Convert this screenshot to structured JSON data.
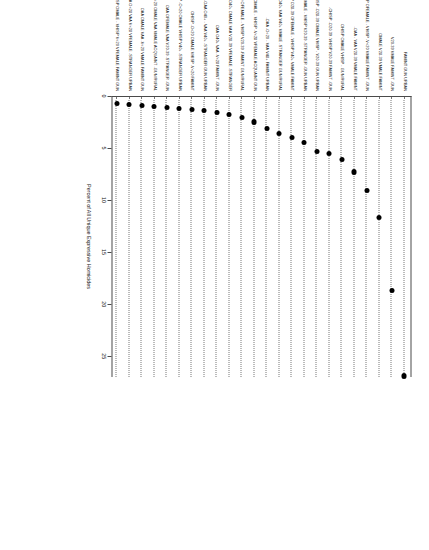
{
  "figure": {
    "orientation": "rotated-90-landscape-on-portrait-page",
    "background_color": "#ffffff",
    "dot_color": "#000000",
    "guide_style": "dotted",
    "axis_color": "#4a4a4a"
  },
  "chart_data": {
    "type": "scatter",
    "title": "",
    "subtitle": "",
    "xlabel": "Percent of All Unique Expressive Homicides",
    "ylabel": "",
    "xlim": [
      0,
      27
    ],
    "xticks": [
      0,
      5,
      10,
      15,
      20,
      25
    ],
    "xticklabels": [
      "0",
      "5",
      "10",
      "15",
      "20",
      "25"
    ],
    "grid": "dotted-horizontal-guides-per-category",
    "legend": "none",
    "categories": [
      "FAMINT GUN URBAN",
      "V20-39 VMALE FAMINT -GUN",
      "OMALE V20-39 VMALE FAMINT",
      "-CHISP OFEMALE - VHISP -V<20 VMALE FAMINT -GUN",
      "-OAA - VAA V20-39 VMALE FAMINT",
      "OHISP OMALE VHISP - GUN RURAL",
      "-CHISP -O20-39 -VHISP V20-39 FAMINT -GUN",
      "-CHISP -O20-39 OMALE VHISP - V20-39 GUN URBAN",
      "-CHISP OFEMALE - VHISP V20-39 -STRANGER -GUN URBAN",
      "-CHISP O20-39 OFEMALE - VHISP V40+ VMALE FAMINT",
      "OAA O40+ VAA V40+ VMALE -STRANGER GUN RURAL",
      "-OAA -O<20 - VAA V40+ FAMINT URBAN",
      "-CHISP O40+ OMALE - VHISP -V<20 VFEMALE ACQUAINT GUN",
      "-CHISP O20-39 OFEMALE - VHISP V20-39 -FAMINT GUN RURAL",
      "OAA O40+ OMALE VAA V20-39 VFEMALE -STRANGER",
      "OAA O40+ VAA -V<20 FAMINT -GUN",
      "-OAA O40+ - VAA V40+ -STRANGER GUN URBAN",
      "OHISP -O<20 OMALE VHISP -V<20 FAMINT",
      "OHISP -O<20 OMALE VHISP V40+ -STRANGER URBAN",
      "OAA OFEMALE VAA V20-39 -STRANGER -GUN",
      "OAA O<20 OMALE VAA VMALE ACQUAINT -GUN RURAL",
      "OAA OMALE VAA -V<20 VMALE FAMINT GUN",
      "OAA O<20 VAA V<20 VFEMALE -STRANGER URBAN",
      "-OHISP OMALE - VHISP V<20 VFEMALE FAMINT GUN"
    ],
    "values": [
      26.8,
      18.6,
      11.6,
      9.0,
      7.2,
      6.0,
      5.4,
      5.2,
      4.4,
      3.9,
      3.5,
      3.0,
      2.4,
      2.0,
      1.7,
      1.5,
      1.3,
      1.2,
      1.1,
      1.0,
      0.9,
      0.8,
      0.7,
      0.6
    ]
  },
  "axis": {
    "x_title": "Percent of All Unique Expressive Homicides",
    "tick_labels": [
      "0",
      "5",
      "10",
      "15",
      "20",
      "25"
    ]
  }
}
